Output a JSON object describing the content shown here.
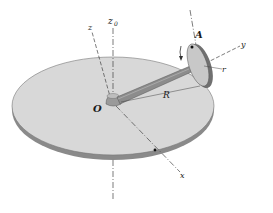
{
  "diagram": {
    "type": "mechanics-figure",
    "labels": {
      "z0": "z",
      "z0_sub": "0",
      "z": "z",
      "y": "y",
      "x": "x",
      "O": "O",
      "A": "A",
      "R": "R",
      "r": "r"
    },
    "colors": {
      "disk_top": "#d9d9d9",
      "disk_edge": "#8a8a8a",
      "arm": "#8c8c8c",
      "wheel": "#9a9a9a",
      "line": "#333333"
    }
  }
}
